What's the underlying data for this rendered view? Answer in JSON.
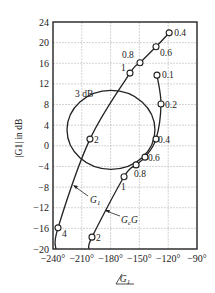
{
  "chart_data": {
    "type": "line",
    "title": "",
    "xlabel": "/G1",
    "ylabel": "|G1| in dB",
    "xlim": [
      -240,
      -90
    ],
    "ylim": [
      -20,
      24
    ],
    "grid": true,
    "x_ticks": [
      -240,
      -210,
      -180,
      -150,
      -120,
      -90
    ],
    "x_tick_labels": [
      "−240°",
      "−210°",
      "−180°",
      "−150°",
      "−120°",
      "−90°"
    ],
    "y_ticks": [
      -20,
      -16,
      -12,
      -8,
      -4,
      0,
      4,
      8,
      12,
      16,
      20,
      24
    ],
    "y_tick_labels": [
      "−20",
      "−16",
      "−12",
      "−8",
      "−4",
      "0",
      "4",
      "8",
      "12",
      "16",
      "20",
      "24"
    ],
    "series": [
      {
        "name": "G1",
        "label": "G",
        "label_sub": "1",
        "points": [
          {
            "x": -119,
            "y": 21.9,
            "freq": "0.4"
          },
          {
            "x": -132.7,
            "y": 19.2,
            "freq": "0.6"
          },
          {
            "x": -149.4,
            "y": 16.1,
            "freq": "0.8"
          },
          {
            "x": -159.8,
            "y": 14.1,
            "freq": "1"
          },
          {
            "x": -201.5,
            "y": 1.3,
            "freq": "2"
          },
          {
            "x": -234.8,
            "y": -15.9,
            "freq": "4"
          }
        ],
        "tail": {
          "x": -237,
          "y": -20
        }
      },
      {
        "name": "GcG",
        "label": "G",
        "label_sub": "c",
        "label_suffix": "G",
        "points": [
          {
            "x": -131.7,
            "y": 13.7,
            "freq": "0.1"
          },
          {
            "x": -127.5,
            "y": 8.1,
            "freq": "0.2"
          },
          {
            "x": -132.7,
            "y": 1.3,
            "freq": "0.4"
          },
          {
            "x": -144.2,
            "y": -2.2,
            "freq": "0.6"
          },
          {
            "x": -153.5,
            "y": -3.7,
            "freq": "0.8"
          },
          {
            "x": -166,
            "y": -6.0,
            "freq": "1"
          },
          {
            "x": -199.4,
            "y": -17.7,
            "freq": "2"
          }
        ],
        "tail": {
          "x": -202.5,
          "y": -20
        }
      }
    ],
    "contour": {
      "label": "3 dB",
      "center": {
        "x": -179.6,
        "y": 3.1
      },
      "radius_deg": 45.8,
      "radius_db": 7.65
    }
  }
}
